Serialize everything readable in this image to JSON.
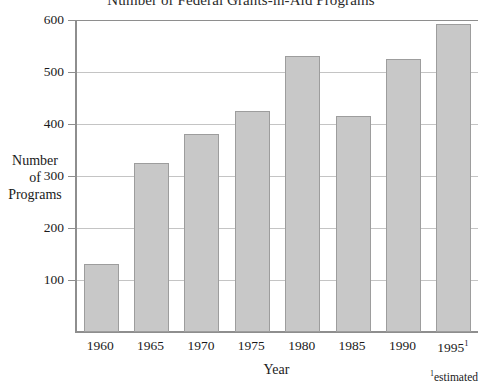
{
  "chart_data": {
    "type": "bar",
    "title": "Number of Federal Grants-in-Aid Programs",
    "xlabel": "Year",
    "ylabel_lines": [
      "Number",
      "of",
      "Programs"
    ],
    "categories": [
      "1960",
      "1965",
      "1970",
      "1975",
      "1980",
      "1985",
      "1990",
      "1995"
    ],
    "category_labels_display": [
      "1960",
      "1965",
      "1970",
      "1975",
      "1980",
      "1985",
      "1990",
      "1995¹"
    ],
    "values": [
      130,
      325,
      380,
      425,
      530,
      415,
      525,
      593
    ],
    "ylim": [
      0,
      600
    ],
    "yticks": [
      100,
      200,
      300,
      400,
      500,
      600
    ],
    "ytick_labels": [
      "100",
      "200",
      "300",
      "400",
      "500",
      "600"
    ],
    "grid": true,
    "legend": null,
    "footnote": "estimated",
    "footnote_marker": "1",
    "colors": {
      "bar_fill": "#c8c8c8",
      "bar_border": "#9d9d9d",
      "gridline": "#c4c4c4",
      "axis": "#8e8e8e",
      "text": "#1a1a1a",
      "background": "#ffffff"
    }
  }
}
